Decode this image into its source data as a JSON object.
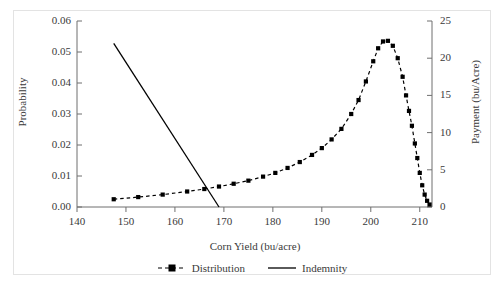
{
  "chart_data": {
    "type": "line",
    "title": "",
    "xlabel": "Corn Yield (bu/acre)",
    "ylabel": "Probability",
    "y2label": "Payment (bu/Acre)",
    "xlim": [
      140,
      212.5
    ],
    "ylim": [
      0.0,
      0.06
    ],
    "y2lim": [
      0,
      25
    ],
    "xticks": [
      140,
      150,
      160,
      170,
      180,
      190,
      200,
      210
    ],
    "xticklabels": [
      "140",
      "150",
      "160",
      "170",
      "180",
      "190",
      "200",
      "210"
    ],
    "yticks": [
      0.0,
      0.01,
      0.02,
      0.03,
      0.04,
      0.05,
      0.06
    ],
    "yticklabels": [
      "0.00",
      "0.01",
      "0.02",
      "0.03",
      "0.04",
      "0.05",
      "0.06"
    ],
    "y2ticks": [
      0,
      5,
      10,
      15,
      20,
      25
    ],
    "y2ticklabels": [
      "0",
      "5",
      "10",
      "15",
      "20",
      "25"
    ],
    "grid": false,
    "legend_position": "bottom-center",
    "series": [
      {
        "name": "Distribution",
        "axis": "left",
        "style": "dashed-with-square-markers",
        "color": "#000000",
        "x": [
          147.5,
          152.5,
          157.5,
          162.5,
          166.0,
          169.0,
          172.0,
          175.0,
          178.0,
          180.5,
          183.0,
          185.5,
          188.0,
          190.0,
          192.0,
          194.0,
          196.0,
          197.5,
          199.0,
          200.5,
          201.5,
          202.5,
          203.5,
          204.5,
          205.5,
          206.5,
          207.2,
          207.8,
          208.4,
          209.0,
          209.5,
          210.0,
          210.5,
          211.0,
          211.5,
          212.0
        ],
        "y": [
          0.0025,
          0.0032,
          0.004,
          0.005,
          0.0058,
          0.0066,
          0.0075,
          0.0085,
          0.0098,
          0.011,
          0.0126,
          0.0145,
          0.0168,
          0.019,
          0.0218,
          0.0252,
          0.03,
          0.0345,
          0.0405,
          0.047,
          0.0512,
          0.0534,
          0.0536,
          0.052,
          0.048,
          0.042,
          0.036,
          0.031,
          0.0262,
          0.0205,
          0.0158,
          0.011,
          0.007,
          0.004,
          0.002,
          0.0008
        ]
      },
      {
        "name": "Indemnity",
        "axis": "right",
        "style": "solid",
        "color": "#000000",
        "x": [
          147.5,
          169.0
        ],
        "y": [
          22.0,
          0.0
        ]
      }
    ]
  },
  "legend": {
    "items": [
      {
        "label": "Distribution",
        "marker": "dashed-square-marker"
      },
      {
        "label": "Indemnity",
        "marker": "solid-line"
      }
    ]
  }
}
